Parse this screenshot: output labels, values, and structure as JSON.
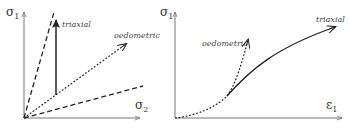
{
  "left_panel": {
    "y_axis_label": "σ",
    "y_axis_sub": "1",
    "x_axis_label": "σ",
    "x_axis_sub": "2",
    "paths": [
      {
        "name": "triaxial",
        "style": "solid",
        "label": "triaxial"
      },
      {
        "name": "oedometric",
        "style": "dotted",
        "label": "oedometric"
      },
      {
        "name": "upper-bound",
        "style": "dashed"
      },
      {
        "name": "lower-bound",
        "style": "dashed"
      }
    ]
  },
  "right_panel": {
    "y_axis_label": "σ",
    "y_axis_sub": "1",
    "x_axis_label": "ε",
    "x_axis_sub": "1",
    "paths": [
      {
        "name": "oedometric",
        "style": "dotted",
        "label": "oedometric"
      },
      {
        "name": "triaxial",
        "style": "solid",
        "label": "triaxial"
      }
    ]
  },
  "colors": {
    "line": "#222222",
    "axis": "#666666",
    "text": "#444444"
  }
}
